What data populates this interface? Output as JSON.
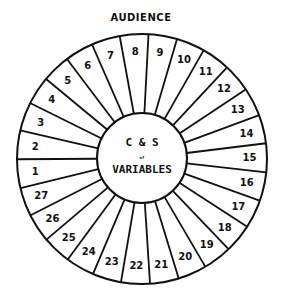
{
  "title": "AUDIENCE",
  "center": {
    "line1": "C & S",
    "line2": "of",
    "line3": "VARIABLES"
  },
  "wheel": {
    "segment_count": 27,
    "first_boundary_deg": 3,
    "segments": [
      "1",
      "2",
      "3",
      "4",
      "5",
      "6",
      "7",
      "8",
      "9",
      "10",
      "11",
      "12",
      "13",
      "14",
      "15",
      "16",
      "17",
      "18",
      "19",
      "20",
      "21",
      "22",
      "23",
      "24",
      "25",
      "26",
      "27"
    ],
    "line_color": "#111111",
    "background": "#ffffff"
  }
}
